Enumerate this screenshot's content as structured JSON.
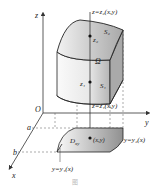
{
  "axes": {
    "z": "z",
    "y": "y",
    "x": "x",
    "origin": "O",
    "a": "a",
    "b": "b"
  },
  "surfaces": {
    "top_eq": "z=z₂(x,y)",
    "bottom_eq": "z=z₁(x,y)",
    "top_label": "S₂",
    "bottom_label": "S₁",
    "top_point": "z₂",
    "bottom_point": "z₁",
    "region": "Ω"
  },
  "domain": {
    "label": "D",
    "label_sub": "xy",
    "point": "(x,y)",
    "upper_curve": "y=y₂(x)",
    "lower_curve": "y=y₁(x)"
  },
  "caption": "图"
}
